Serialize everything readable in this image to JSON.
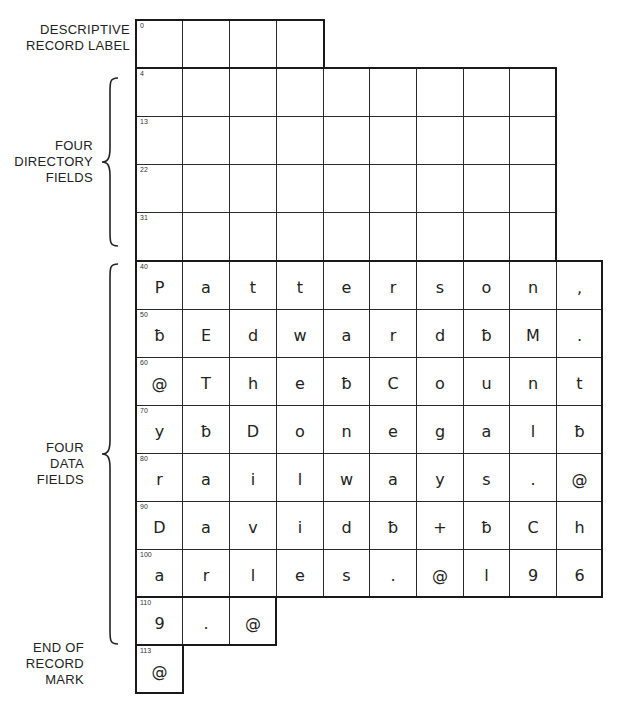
{
  "labels": {
    "descriptive_record_label": [
      "DESCRIPTIVE",
      "RECORD LABEL"
    ],
    "directory_fields": [
      "FOUR",
      "DIRECTORY",
      "FIELDS"
    ],
    "data_fields": [
      "FOUR",
      "DATA",
      "FIELDS"
    ],
    "end_of_record": [
      "END OF",
      "RECORD",
      "MARK"
    ]
  },
  "record_label": {
    "start": "0",
    "cells": [
      "",
      "",
      "",
      ""
    ]
  },
  "directory": {
    "rows": [
      {
        "start": "4",
        "cells": [
          "",
          "",
          "",
          "",
          "",
          "",
          "",
          "",
          ""
        ]
      },
      {
        "start": "13",
        "cells": [
          "",
          "",
          "",
          "",
          "",
          "",
          "",
          "",
          ""
        ]
      },
      {
        "start": "22",
        "cells": [
          "",
          "",
          "",
          "",
          "",
          "",
          "",
          "",
          ""
        ]
      },
      {
        "start": "31",
        "cells": [
          "",
          "",
          "",
          "",
          "",
          "",
          "",
          "",
          ""
        ]
      }
    ]
  },
  "data": {
    "rows": [
      {
        "start": "40",
        "cells": [
          "P",
          "a",
          "t",
          "t",
          "e",
          "r",
          "s",
          "o",
          "n",
          ","
        ]
      },
      {
        "start": "50",
        "cells": [
          "ƀ",
          "E",
          "d",
          "w",
          "a",
          "r",
          "d",
          "ƀ",
          "M",
          "."
        ]
      },
      {
        "start": "60",
        "cells": [
          "@",
          "T",
          "h",
          "e",
          "ƀ",
          "C",
          "o",
          "u",
          "n",
          "t"
        ]
      },
      {
        "start": "70",
        "cells": [
          "y",
          "ƀ",
          "D",
          "o",
          "n",
          "e",
          "g",
          "a",
          "l",
          "ƀ"
        ]
      },
      {
        "start": "80",
        "cells": [
          "r",
          "a",
          "i",
          "l",
          "w",
          "a",
          "y",
          "s",
          ".",
          "@"
        ]
      },
      {
        "start": "90",
        "cells": [
          "D",
          "a",
          "v",
          "i",
          "d",
          "ƀ",
          "+",
          "ƀ",
          "C",
          "h"
        ]
      },
      {
        "start": "100",
        "cells": [
          "a",
          "r",
          "l",
          "e",
          "s",
          ".",
          "@",
          "l",
          "9",
          "6"
        ]
      },
      {
        "start": "110",
        "cells": [
          "9",
          ".",
          "@"
        ]
      }
    ]
  },
  "end_of_record": {
    "start": "113",
    "cells": [
      "@"
    ]
  },
  "colors": {
    "line": "#2a2a2a",
    "text": "#222222",
    "background": "#ffffff"
  }
}
